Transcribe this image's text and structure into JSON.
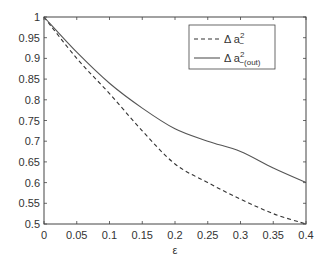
{
  "chart_data": {
    "type": "line",
    "title": "",
    "xlabel": "ε",
    "ylabel": "",
    "xlim": [
      0,
      0.4
    ],
    "ylim": [
      0.5,
      1
    ],
    "xticks": [
      "0",
      "0.05",
      "0.1",
      "0.15",
      "0.2",
      "0.25",
      "0.3",
      "0.35",
      "0.4"
    ],
    "yticks": [
      "0.5",
      "0.55",
      "0.6",
      "0.65",
      "0.7",
      "0.75",
      "0.8",
      "0.85",
      "0.9",
      "0.95",
      "1"
    ],
    "grid": false,
    "legend_position": "upper right",
    "x": [
      0,
      0.05,
      0.1,
      0.15,
      0.2,
      0.25,
      0.3,
      0.35,
      0.4
    ],
    "series": [
      {
        "name": "Δ a²₋",
        "label_main": "Δ a",
        "sup": "2",
        "sub": "−",
        "style": "dashed",
        "color": "#333333",
        "values": [
          1.0,
          0.9,
          0.815,
          0.725,
          0.645,
          0.6,
          0.56,
          0.525,
          0.5
        ]
      },
      {
        "name": "Δ a²₋(out)",
        "label_main": "Δ a",
        "sup": "2",
        "sub": "−(out)",
        "style": "solid",
        "color": "#555555",
        "values": [
          1.0,
          0.915,
          0.84,
          0.78,
          0.73,
          0.7,
          0.675,
          0.635,
          0.6
        ]
      }
    ]
  }
}
